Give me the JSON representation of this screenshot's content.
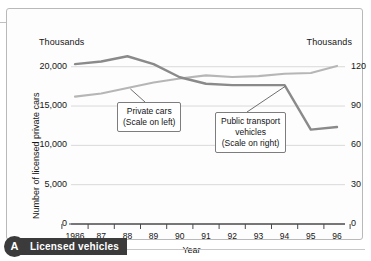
{
  "caption": {
    "badge": "A",
    "label": "Licensed vehicles"
  },
  "chart_data": {
    "type": "line",
    "title": "Licensed vehicles",
    "xlabel": "Year",
    "grid": true,
    "legend": "annotations",
    "left_axis": {
      "unit": "Thousands",
      "label": "Number of licensed private cars",
      "ticks": [
        "0",
        "5,000",
        "10,000",
        "15,000",
        "20,000"
      ],
      "tick_values": [
        0,
        5000,
        10000,
        15000,
        20000
      ],
      "ylim": [
        0,
        22000
      ]
    },
    "right_axis": {
      "unit": "Thousands",
      "label": "Number of licensed public transport vehicles",
      "ticks": [
        "0",
        "30",
        "60",
        "90",
        "120"
      ],
      "tick_values": [
        0,
        30,
        60,
        90,
        120
      ],
      "ylim": [
        0,
        132
      ]
    },
    "categories": [
      "1986",
      "87",
      "88",
      "89",
      "90",
      "91",
      "92",
      "93",
      "94",
      "95",
      "96"
    ],
    "series": [
      {
        "name": "Private cars",
        "scale": "left",
        "color": "#b6b6b6",
        "values": [
          16200,
          16600,
          17300,
          18000,
          18500,
          18900,
          18700,
          18800,
          19100,
          19200,
          20100
        ]
      },
      {
        "name": "Public transport vehicles",
        "scale": "right",
        "color": "#8a8a8a",
        "values": [
          122,
          124,
          128,
          122,
          112,
          107,
          106,
          106,
          106,
          72,
          74
        ]
      }
    ],
    "annotations": [
      {
        "id": "private-cars",
        "lines": [
          "Private cars",
          "(Scale on left)"
        ],
        "points_to": "88"
      },
      {
        "id": "public-transport",
        "lines": [
          "Public transport",
          "vehicles",
          "(Scale on right)"
        ],
        "points_to": "94"
      }
    ]
  }
}
